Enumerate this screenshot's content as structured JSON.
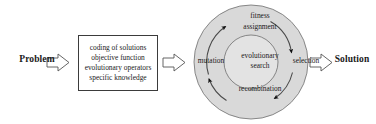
{
  "figure": {
    "type": "process-diagram",
    "background": "#ffffff",
    "title_present": false
  },
  "flow": {
    "input_label": "Problem",
    "output_label": "Solution"
  },
  "spec_box": {
    "lines": [
      "coding of solutions",
      "objective function",
      "evolutionary operators",
      "specific knowledge"
    ],
    "border_color": "#3b3b3b",
    "fill_color": "#ffffff"
  },
  "cycle": {
    "core_lines": [
      "evolutionary",
      "search"
    ],
    "stages": [
      {
        "id": "fitness-assignment",
        "label_lines": [
          "fitness",
          "assignment"
        ],
        "position": "top"
      },
      {
        "id": "selection",
        "label_lines": [
          "selection"
        ],
        "position": "right"
      },
      {
        "id": "recombination",
        "label_lines": [
          "recombination"
        ],
        "position": "bottom"
      },
      {
        "id": "mutation",
        "label_lines": [
          "mutation"
        ],
        "position": "left"
      }
    ],
    "direction": "clockwise",
    "outer_fill": "#d9d9d9",
    "inner_fill": "#e3e3e3",
    "ring_stroke": "#6e6e6e",
    "arrow_color": "#111111"
  },
  "arrows": {
    "block_arrow_stroke": "#555555",
    "block_arrow_fill": "#ffffff",
    "items": [
      {
        "id": "problem-to-box",
        "direction": "right"
      },
      {
        "id": "box-to-cycle",
        "direction": "right"
      },
      {
        "id": "cycle-to-solution",
        "direction": "right"
      }
    ]
  }
}
